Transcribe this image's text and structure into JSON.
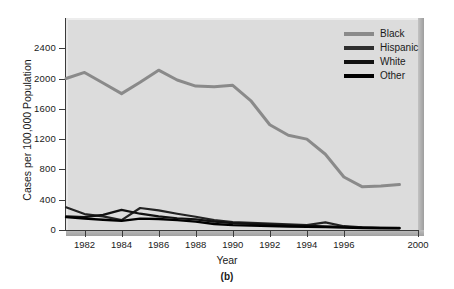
{
  "chart_data": {
    "type": "line",
    "title": "",
    "subtitle": "",
    "xlabel": "Year",
    "ylabel": "Cases per 100,000 Population",
    "panel_label": "(b)",
    "xlim": [
      1981,
      2000
    ],
    "ylim": [
      0,
      2600
    ],
    "xticks": [
      1982,
      1984,
      1986,
      1988,
      1990,
      1992,
      1994,
      1996,
      2000
    ],
    "xtick_labels": [
      "1982",
      "1984",
      "1986",
      "1988",
      "1990",
      "1992",
      "1994",
      "1996",
      "2000"
    ],
    "yticks": [
      0,
      400,
      800,
      1200,
      1600,
      2000,
      2400
    ],
    "ytick_labels": [
      "0",
      "400",
      "800",
      "1200",
      "1600",
      "2000",
      "2400"
    ],
    "grid": false,
    "legend_position": "top-right",
    "x": [
      1981,
      1982,
      1983,
      1984,
      1985,
      1986,
      1987,
      1988,
      1989,
      1990,
      1991,
      1992,
      1993,
      1994,
      1995,
      1996,
      1997,
      1998,
      1999
    ],
    "series": [
      {
        "name": "Black",
        "color": "#8a8a8a",
        "width": 3.0,
        "values": [
          2000,
          2080,
          1940,
          1800,
          1950,
          2110,
          1980,
          1900,
          1890,
          1910,
          1700,
          1390,
          1250,
          1200,
          1000,
          700,
          570,
          580,
          600
        ]
      },
      {
        "name": "Hispanic",
        "color": "#232323",
        "width": 2.2,
        "values": [
          300,
          210,
          180,
          130,
          290,
          260,
          215,
          175,
          130,
          105,
          95,
          85,
          75,
          65,
          100,
          50,
          35,
          30,
          30
        ]
      },
      {
        "name": "White",
        "color": "#111111",
        "width": 2.2,
        "values": [
          180,
          170,
          200,
          265,
          215,
          180,
          155,
          140,
          110,
          90,
          80,
          70,
          62,
          55,
          48,
          40,
          32,
          28,
          26
        ]
      },
      {
        "name": "Other",
        "color": "#000000",
        "width": 2.4,
        "values": [
          170,
          150,
          135,
          120,
          150,
          145,
          130,
          110,
          80,
          65,
          58,
          52,
          46,
          42,
          38,
          32,
          26,
          24,
          22
        ]
      }
    ]
  },
  "legend": {
    "entries": [
      {
        "label": "Black",
        "color": "#8a8a8a"
      },
      {
        "label": "Hispanic",
        "color": "#2e2e2e"
      },
      {
        "label": "White",
        "color": "#111111"
      },
      {
        "label": "Other",
        "color": "#000000"
      }
    ]
  },
  "axes": {
    "plot_background_color": "#dcdcdc",
    "axis_color": "#3a3a3a"
  }
}
